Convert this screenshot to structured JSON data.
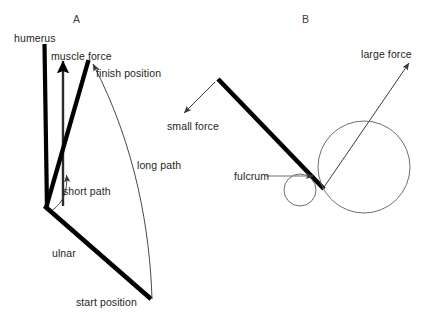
{
  "figure": {
    "background_color": "#ffffff",
    "ink_color": "#231f20",
    "thin_line_color": "#58595b",
    "width": 437,
    "height": 325
  },
  "panels": [
    {
      "id": "A",
      "letter": "A",
      "letter_pos": {
        "x": 73,
        "y": 14
      },
      "subject": "human arm: humerus, ulnar, muscle force, arc paths"
    },
    {
      "id": "B",
      "letter": "B",
      "letter_pos": {
        "x": 302,
        "y": 14
      },
      "subject": "lever with fulcrum and two concentric circles showing small and large force"
    }
  ],
  "labels": {
    "humerus": {
      "text": "humerus",
      "x": 14,
      "y": 33
    },
    "muscle_force": {
      "text": "muscle force",
      "x": 51,
      "y": 51
    },
    "finish_position": {
      "text": "finish position",
      "x": 96,
      "y": 68
    },
    "long_path": {
      "text": "long path",
      "x": 137,
      "y": 160
    },
    "short_path": {
      "text": "short path",
      "x": 63,
      "y": 186
    },
    "ulnar": {
      "text": "ulnar",
      "x": 52,
      "y": 248
    },
    "start_position": {
      "text": "start position",
      "x": 76,
      "y": 297
    },
    "small_force": {
      "text": "small force",
      "x": 167,
      "y": 121
    },
    "large_force": {
      "text": "large force",
      "x": 361,
      "y": 49
    },
    "fulcrum": {
      "text": "fulcrum",
      "x": 234,
      "y": 177
    }
  },
  "geometry": {
    "panel_a": {
      "humerus_bar": {
        "x1": 44,
        "y1": 44,
        "x2": 47,
        "y2": 209,
        "stroke_width": 4
      },
      "muscle_force_arrow": {
        "x1": 63,
        "y1": 206,
        "x2": 63,
        "y2": 58,
        "stroke_width": 2.6
      },
      "ulna_finish": {
        "x1": 46,
        "y1": 207,
        "x2": 89,
        "y2": 60,
        "stroke_width": 4.5
      },
      "ulna_start": {
        "x1": 45,
        "y1": 206,
        "x2": 151,
        "y2": 299,
        "stroke_width": 4.5
      },
      "long_path_arc": {
        "from": {
          "x": 152,
          "y": 298
        },
        "to": {
          "x": 92,
          "y": 62
        }
      },
      "short_path_arc": {
        "from": {
          "x": 52,
          "y": 209
        },
        "to": {
          "x": 66,
          "y": 173
        }
      }
    },
    "panel_b": {
      "lever": {
        "x1": 218,
        "y1": 79,
        "x2": 323,
        "y2": 188,
        "stroke_width": 4.5
      },
      "small_force_arrow": {
        "x1": 216,
        "y1": 81,
        "x2": 183,
        "y2": 114
      },
      "large_force_arrow": {
        "x1": 322,
        "y1": 189,
        "x2": 410,
        "y2": 62
      },
      "small_circle": {
        "cx": 300,
        "cy": 190,
        "r": 16
      },
      "large_circle": {
        "cx": 364,
        "cy": 167,
        "r": 46
      },
      "fulcrum_leader": {
        "x1": 266,
        "y1": 175,
        "x2": 316,
        "y2": 175
      }
    }
  }
}
